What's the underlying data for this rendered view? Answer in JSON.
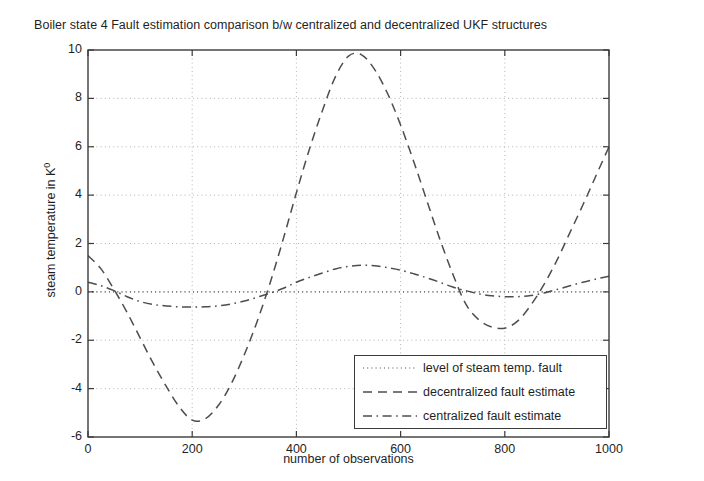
{
  "chart_data": {
    "type": "line",
    "title": "Boiler state 4 Fault estimation comparison b/w centralized and decentralized UKF structures",
    "xlabel": "number of observations",
    "ylabel_text": "steam temperature in K",
    "ylabel_sup": "0",
    "xlim": [
      0,
      1000
    ],
    "ylim": [
      -6,
      10
    ],
    "xticks": [
      0,
      200,
      400,
      600,
      800,
      1000
    ],
    "yticks": [
      -6,
      -4,
      -2,
      0,
      2,
      4,
      6,
      8,
      10
    ],
    "xtick_labels": [
      "0",
      "200",
      "400",
      "600",
      "800",
      "1000"
    ],
    "ytick_labels": [
      "-6",
      "-4",
      "-2",
      "0",
      "2",
      "4",
      "6",
      "8",
      "10"
    ],
    "grid": true,
    "grid_style": "dotted",
    "legend_position": "lower right",
    "line_color": "#4d4d4d",
    "grid_color": "#b5b5b5",
    "axis_color": "#3b3b3b",
    "series": [
      {
        "name": "level of steam temp. fault",
        "style": "dotted",
        "x": [
          0,
          1000
        ],
        "values": [
          0,
          0
        ]
      },
      {
        "name": "decentralized fault estimate",
        "style": "dashed",
        "x": [
          0,
          25,
          50,
          75,
          100,
          125,
          150,
          175,
          200,
          225,
          250,
          275,
          300,
          325,
          350,
          375,
          400,
          425,
          450,
          475,
          500,
          525,
          550,
          575,
          600,
          625,
          650,
          675,
          700,
          725,
          750,
          775,
          800,
          825,
          850,
          875,
          900,
          925,
          950,
          975,
          1000
        ],
        "values": [
          1.5,
          0.95,
          0.1,
          -0.85,
          -1.9,
          -2.95,
          -3.9,
          -4.75,
          -5.3,
          -5.25,
          -4.7,
          -3.8,
          -2.6,
          -1.2,
          0.4,
          2.2,
          4.1,
          5.9,
          7.5,
          8.9,
          9.75,
          9.8,
          9.2,
          8.2,
          6.9,
          5.4,
          3.8,
          2.2,
          0.75,
          -0.5,
          -1.15,
          -1.45,
          -1.5,
          -1.2,
          -0.55,
          0.3,
          1.3,
          2.45,
          3.6,
          4.8,
          6.0
        ]
      },
      {
        "name": "centralized fault estimate",
        "style": "dashdot",
        "x": [
          0,
          25,
          50,
          75,
          100,
          125,
          150,
          175,
          200,
          225,
          250,
          275,
          300,
          325,
          350,
          375,
          400,
          425,
          450,
          475,
          500,
          525,
          550,
          575,
          600,
          625,
          650,
          675,
          700,
          725,
          750,
          775,
          800,
          825,
          850,
          875,
          900,
          925,
          950,
          975,
          1000
        ],
        "values": [
          0.4,
          0.25,
          0.05,
          -0.2,
          -0.4,
          -0.52,
          -0.58,
          -0.62,
          -0.63,
          -0.62,
          -0.58,
          -0.5,
          -0.38,
          -0.22,
          -0.05,
          0.15,
          0.4,
          0.6,
          0.78,
          0.95,
          1.05,
          1.1,
          1.08,
          1.0,
          0.9,
          0.75,
          0.58,
          0.4,
          0.2,
          0.05,
          -0.08,
          -0.16,
          -0.2,
          -0.2,
          -0.15,
          -0.05,
          0.1,
          0.25,
          0.4,
          0.53,
          0.65
        ]
      }
    ]
  },
  "legend": {
    "items": [
      {
        "label": "level of steam temp. fault",
        "style": "dotted"
      },
      {
        "label": "decentralized fault estimate",
        "style": "dashed"
      },
      {
        "label": "centralized fault estimate",
        "style": "dashdot"
      }
    ]
  }
}
